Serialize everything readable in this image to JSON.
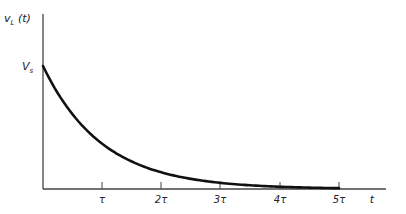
{
  "chart_data": {
    "type": "line",
    "title": "",
    "ylabel": "v_L (t)",
    "xlabel": "t",
    "y_marker": "V_s",
    "x_ticks": [
      "τ",
      "2τ",
      "3τ",
      "4τ",
      "5τ"
    ],
    "x_tick_values": [
      1,
      2,
      3,
      4,
      5
    ],
    "function": "V_s * exp(-t/τ)",
    "x": [
      0,
      0.5,
      1,
      1.5,
      2,
      2.5,
      3,
      3.5,
      4,
      4.5,
      5
    ],
    "y_normalized": [
      1.0,
      0.607,
      0.368,
      0.223,
      0.135,
      0.082,
      0.05,
      0.03,
      0.018,
      0.011,
      0.007
    ],
    "xlim": [
      0,
      5.8
    ],
    "ylim": [
      0,
      1.0
    ],
    "grid": false,
    "legend": "none"
  },
  "labels": {
    "y_axis": "v",
    "y_axis_sub": "L",
    "y_axis_arg": " (t)",
    "vs_main": "V",
    "vs_sub": "s",
    "x_axis": "t",
    "ticks": [
      "τ",
      "2τ",
      "3τ",
      "4τ",
      "5τ"
    ]
  },
  "colors": {
    "curve": "#111111",
    "axes": "#444444"
  }
}
